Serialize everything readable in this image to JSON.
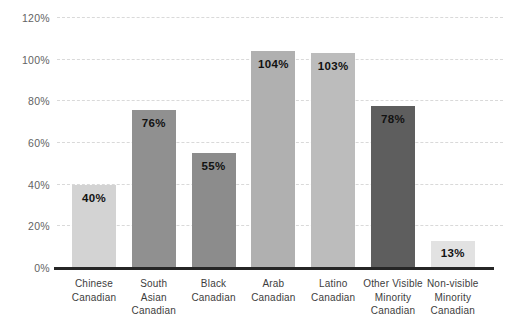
{
  "chart_data": {
    "type": "bar",
    "title": "",
    "xlabel": "",
    "ylabel": "",
    "categories": [
      "Chinese\nCanadian",
      "South\nAsian\nCanadian",
      "Black\nCanadian",
      "Arab\nCanadian",
      "Latino\nCanadian",
      "Other Visible\nMinority\nCanadian",
      "Non-visible\nMinority\nCanadian"
    ],
    "values": [
      40,
      76,
      55,
      104,
      103,
      78,
      13
    ],
    "value_labels": [
      "40%",
      "76%",
      "55%",
      "104%",
      "103%",
      "78%",
      "13%"
    ],
    "bar_colors": [
      "#d3d3d3",
      "#909090",
      "#8c8c8c",
      "#b0b0b0",
      "#bcbcbc",
      "#5e5e5e",
      "#e2e2e2"
    ],
    "ylim": [
      0,
      120
    ],
    "ytick_step": 20,
    "ytick_labels": [
      "0%",
      "20%",
      "40%",
      "60%",
      "80%",
      "100%",
      "120%"
    ],
    "grid": true,
    "legend": false,
    "gridline_color": "#d9d9d9",
    "axis_color": "#262626",
    "value_label_color": "#121212",
    "ytick_color": "#636363",
    "xtick_color": "#3d3d3d",
    "background_color": "#ffffff"
  }
}
